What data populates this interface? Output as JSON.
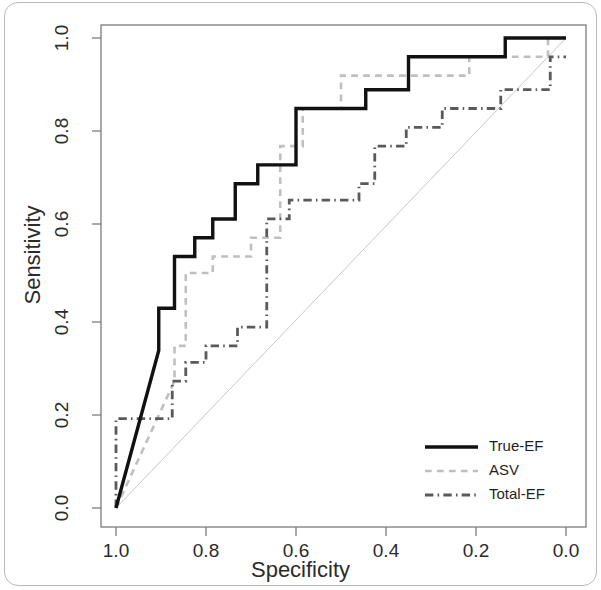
{
  "figure": {
    "background": "#ffffff",
    "frame_color": "#b9b9b9"
  },
  "chart_data": {
    "type": "line",
    "title": "",
    "subtitle": "",
    "xlabel": "Specificity",
    "ylabel": "Sensitivity",
    "xlim": [
      1.0,
      0.0
    ],
    "ylim": [
      0.0,
      1.0
    ],
    "x_axis_reversed": true,
    "grid": false,
    "legend_position": "bottom-right",
    "xticks": [
      "1.0",
      "0.8",
      "0.6",
      "0.4",
      "0.2",
      "0.0"
    ],
    "xtick_values": [
      1.0,
      0.8,
      0.6,
      0.4,
      0.2,
      0.0
    ],
    "yticks": [
      "0.0",
      "0.2",
      "0.4",
      "0.6",
      "0.8",
      "1.0"
    ],
    "ytick_values": [
      0.0,
      0.2,
      0.4,
      0.6,
      0.8,
      1.0
    ],
    "reference_line": {
      "name": "chance-diagonal",
      "from": [
        1.0,
        0.0
      ],
      "to": [
        0.0,
        1.0
      ],
      "color": "#c8c8c8",
      "width": 1,
      "dash": "none"
    },
    "series": [
      {
        "name": "True-EF",
        "color": "#111111",
        "width": 3.4,
        "dash": "solid",
        "points": [
          [
            1.0,
            0.0
          ],
          [
            0.905,
            0.335
          ],
          [
            0.905,
            0.425
          ],
          [
            0.87,
            0.425
          ],
          [
            0.87,
            0.535
          ],
          [
            0.825,
            0.535
          ],
          [
            0.825,
            0.575
          ],
          [
            0.785,
            0.575
          ],
          [
            0.785,
            0.615
          ],
          [
            0.735,
            0.615
          ],
          [
            0.735,
            0.69
          ],
          [
            0.685,
            0.69
          ],
          [
            0.685,
            0.73
          ],
          [
            0.6,
            0.73
          ],
          [
            0.6,
            0.85
          ],
          [
            0.445,
            0.85
          ],
          [
            0.445,
            0.89
          ],
          [
            0.35,
            0.89
          ],
          [
            0.35,
            0.96
          ],
          [
            0.135,
            0.96
          ],
          [
            0.135,
            1.0
          ],
          [
            0.0,
            1.0
          ]
        ]
      },
      {
        "name": "ASV",
        "color": "#bfbfbf",
        "width": 2.6,
        "dash": "dashed",
        "points": [
          [
            1.0,
            0.0
          ],
          [
            0.87,
            0.27
          ],
          [
            0.87,
            0.345
          ],
          [
            0.845,
            0.345
          ],
          [
            0.845,
            0.5
          ],
          [
            0.785,
            0.5
          ],
          [
            0.785,
            0.535
          ],
          [
            0.7,
            0.535
          ],
          [
            0.7,
            0.575
          ],
          [
            0.635,
            0.575
          ],
          [
            0.635,
            0.77
          ],
          [
            0.585,
            0.77
          ],
          [
            0.585,
            0.85
          ],
          [
            0.5,
            0.85
          ],
          [
            0.5,
            0.92
          ],
          [
            0.215,
            0.92
          ],
          [
            0.215,
            0.96
          ],
          [
            0.04,
            0.96
          ],
          [
            0.04,
            1.0
          ],
          [
            0.0,
            1.0
          ]
        ]
      },
      {
        "name": "Total-EF",
        "color": "#5a5a5a",
        "width": 2.8,
        "dash": "dashdot",
        "points": [
          [
            1.0,
            0.0
          ],
          [
            1.0,
            0.19
          ],
          [
            0.875,
            0.19
          ],
          [
            0.875,
            0.27
          ],
          [
            0.845,
            0.27
          ],
          [
            0.845,
            0.31
          ],
          [
            0.8,
            0.31
          ],
          [
            0.8,
            0.345
          ],
          [
            0.73,
            0.345
          ],
          [
            0.73,
            0.385
          ],
          [
            0.665,
            0.385
          ],
          [
            0.665,
            0.615
          ],
          [
            0.615,
            0.615
          ],
          [
            0.615,
            0.655
          ],
          [
            0.46,
            0.655
          ],
          [
            0.46,
            0.69
          ],
          [
            0.425,
            0.69
          ],
          [
            0.425,
            0.77
          ],
          [
            0.355,
            0.77
          ],
          [
            0.355,
            0.81
          ],
          [
            0.275,
            0.81
          ],
          [
            0.275,
            0.85
          ],
          [
            0.145,
            0.85
          ],
          [
            0.145,
            0.89
          ],
          [
            0.035,
            0.89
          ],
          [
            0.035,
            0.96
          ],
          [
            0.0,
            0.96
          ]
        ]
      }
    ],
    "legend": [
      {
        "label": "True-EF",
        "color": "#111111",
        "dash": "solid",
        "width": 3.4
      },
      {
        "label": "ASV",
        "color": "#bfbfbf",
        "dash": "dashed",
        "width": 2.6
      },
      {
        "label": "Total-EF",
        "color": "#5a5a5a",
        "dash": "dashdot",
        "width": 2.8
      }
    ]
  },
  "axes_geometry": {
    "plot_left": 101,
    "plot_right": 586,
    "plot_top": 25,
    "plot_bottom": 527,
    "x_tick_pixels": [
      116,
      206,
      296,
      386,
      476,
      566
    ],
    "y_tick_pixels": [
      508,
      415,
      322,
      224,
      131,
      38
    ],
    "axis_color": "#7c7c7c"
  },
  "legend_geometry": {
    "line_x1": 425,
    "line_x2": 478,
    "text_x": 489,
    "rows_y": [
      447,
      471,
      495
    ]
  }
}
